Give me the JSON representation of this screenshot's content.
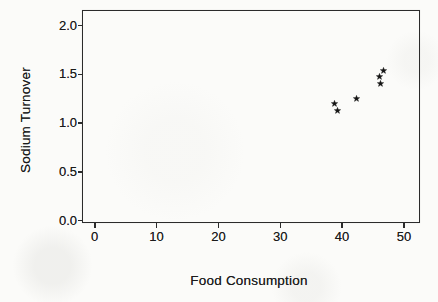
{
  "figure": {
    "kind": "scanned-statistics-scatter-plot"
  },
  "chart_data": {
    "type": "scatter",
    "title": "",
    "xlabel": "Food Consumption",
    "ylabel": "Sodium Turnover",
    "points": [
      {
        "x": 38.8,
        "y": 1.2
      },
      {
        "x": 39.3,
        "y": 1.13
      },
      {
        "x": 42.4,
        "y": 1.25
      },
      {
        "x": 46.0,
        "y": 1.48
      },
      {
        "x": 46.2,
        "y": 1.41
      },
      {
        "x": 46.7,
        "y": 1.54
      }
    ],
    "x_ticks": {
      "values": [
        0,
        10,
        20,
        30,
        40,
        50
      ],
      "labels": [
        "0",
        "10",
        "20",
        "30",
        "40",
        "50"
      ]
    },
    "y_ticks": {
      "values": [
        0.0,
        0.5,
        1.0,
        1.5,
        2.0
      ],
      "labels": [
        "0.0",
        "0.5",
        "1.0",
        "1.5",
        "2.0"
      ]
    },
    "xlim": [
      -1.9,
      52.6
    ],
    "ylim": [
      -0.02,
      2.15
    ],
    "grid": false,
    "legend_position": "none",
    "marker": "star",
    "marker_color": "#141414",
    "frame": "box"
  },
  "colors": {
    "ink": "#1b1b1b",
    "paper": "#fbfbf9",
    "frame": "#2b2b2b"
  }
}
